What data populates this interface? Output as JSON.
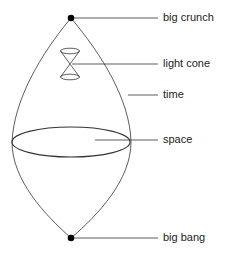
{
  "diagram": {
    "labels": {
      "big_crunch": "big crunch",
      "light_cone": "light cone",
      "time": "time",
      "space": "space",
      "big_bang": "big bang"
    },
    "colors": {
      "line": "#333333",
      "dot": "#000000",
      "text": "#222222"
    }
  }
}
